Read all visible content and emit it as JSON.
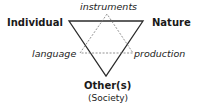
{
  "diagram": {
    "vertices": {
      "top_left": "Individual",
      "top_right": "Nature",
      "bottom": "Other(s)",
      "bottom_sub": "(Society)"
    },
    "mediators": {
      "top": "instruments",
      "left": "language",
      "right": "production"
    },
    "colors": {
      "solid_triangle": "#2b2b2b",
      "dashed_triangle": "#777777",
      "text": "#1a1a1a"
    }
  }
}
